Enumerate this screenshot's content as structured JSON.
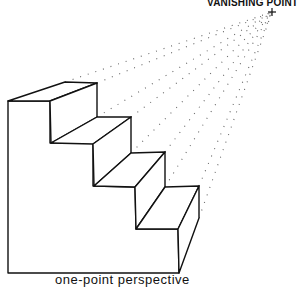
{
  "labels": {
    "vanishing_point": "VANISHING POINT",
    "caption": "one-point perspective"
  },
  "colors": {
    "line": "#111111",
    "dots": "#555555",
    "background": "#ffffff"
  },
  "vanishing_point": {
    "x": 272,
    "y": 12,
    "marker": "+"
  },
  "staircase": {
    "steps": 4,
    "outline": [
      [
        8,
        101
      ],
      [
        8,
        273
      ],
      [
        179,
        273
      ],
      [
        199,
        218
      ],
      [
        199,
        186
      ]
    ]
  }
}
